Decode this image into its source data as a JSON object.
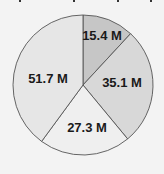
{
  "chart_data": {
    "type": "pie",
    "title": "",
    "start_angle": "12 o'clock, clockwise",
    "categories": [
      "Slice 1",
      "Slice 2",
      "Slice 3",
      "Slice 4"
    ],
    "values": [
      15.4,
      35.1,
      27.3,
      51.7
    ],
    "labels": [
      "15.4 M",
      "35.1 M",
      "27.3 M",
      "51.7 M"
    ],
    "colors": [
      "#c6c6c6",
      "#d8d8d8",
      "#efefef",
      "#e6e6e6"
    ],
    "legend": "none",
    "units": "M"
  },
  "style": {
    "background": "#f3f3f3",
    "stroke": "#555555"
  }
}
